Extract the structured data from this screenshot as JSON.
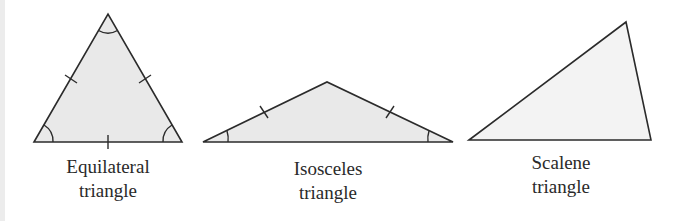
{
  "diagram": {
    "colors": {
      "stroke": "#2b2b2b",
      "fill_equilateral": "#e9e9e9",
      "fill_isosceles": "#e9e9e9",
      "fill_scalene": "#f3f3f3",
      "label": "#2a2a2a"
    },
    "triangles": [
      {
        "id": "equilateral",
        "label_line1": "Equilateral",
        "label_line2": "triangle",
        "vertices": [
          [
            34,
            142
          ],
          [
            108,
            14
          ],
          [
            182,
            142
          ]
        ],
        "equal_side_marks": 3,
        "angle_arcs": 3
      },
      {
        "id": "isosceles",
        "label_line1": "Isosceles",
        "label_line2": "triangle",
        "vertices": [
          [
            203,
            142
          ],
          [
            327,
            82
          ],
          [
            453,
            142
          ]
        ],
        "equal_side_marks": 2,
        "angle_arcs": 2
      },
      {
        "id": "scalene",
        "label_line1": "Scalene",
        "label_line2": "triangle",
        "vertices": [
          [
            469,
            140
          ],
          [
            626,
            22
          ],
          [
            651,
            140
          ]
        ],
        "equal_side_marks": 0,
        "angle_arcs": 0
      }
    ]
  }
}
